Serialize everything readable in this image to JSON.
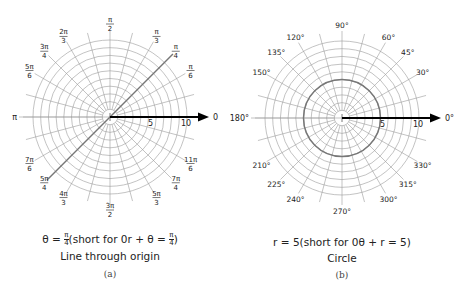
{
  "colors": {
    "grid": "#9a9a9a",
    "axis": "#000000",
    "highlight": "#777777"
  },
  "chart_data": [
    {
      "type": "diagram",
      "title": "Line through origin",
      "panel_label": "(a)",
      "equation": "θ = π/4 (short for 0r + θ = π/4)",
      "center": [
        110,
        117
      ],
      "ring_count": 10,
      "ring_spacing_px": 7.7,
      "axis_labels": {
        "five": "5",
        "ten": "10",
        "zero": "0",
        "pi": "π"
      },
      "angle_labels": [
        {
          "deg": 90,
          "num": "π",
          "den": "2"
        },
        {
          "deg": 60,
          "num": "π",
          "den": "3"
        },
        {
          "deg": 45,
          "num": "π",
          "den": "4"
        },
        {
          "deg": 30,
          "num": "π",
          "den": "6"
        },
        {
          "deg": 120,
          "num": "2π",
          "den": "3"
        },
        {
          "deg": 135,
          "num": "3π",
          "den": "4"
        },
        {
          "deg": 150,
          "num": "5π",
          "den": "6"
        },
        {
          "deg": 210,
          "num": "7π",
          "den": "6"
        },
        {
          "deg": 225,
          "num": "5π",
          "den": "4"
        },
        {
          "deg": 240,
          "num": "4π",
          "den": "3"
        },
        {
          "deg": 270,
          "num": "3π",
          "den": "2"
        },
        {
          "deg": 300,
          "num": "5π",
          "den": "3"
        },
        {
          "deg": 315,
          "num": "7π",
          "den": "4"
        },
        {
          "deg": 330,
          "num": "11π",
          "den": "6"
        }
      ],
      "plotted": {
        "kind": "line",
        "theta_deg": 45
      }
    },
    {
      "type": "diagram",
      "title": "Circle",
      "panel_label": "(b)",
      "equation": "r = 5 (short for 0θ + r = 5)",
      "center": [
        342,
        118
      ],
      "ring_count": 10,
      "ring_spacing_px": 7.7,
      "axis_labels": {
        "five": "5",
        "ten": "10",
        "zero": "0°",
        "pi": "180°"
      },
      "angle_labels": [
        {
          "deg": 90,
          "text": "90°"
        },
        {
          "deg": 60,
          "text": "60°"
        },
        {
          "deg": 45,
          "text": "45°"
        },
        {
          "deg": 30,
          "text": "30°"
        },
        {
          "deg": 120,
          "text": "120°"
        },
        {
          "deg": 135,
          "text": "135°"
        },
        {
          "deg": 150,
          "text": "150°"
        },
        {
          "deg": 210,
          "text": "210°"
        },
        {
          "deg": 225,
          "text": "225°"
        },
        {
          "deg": 240,
          "text": "240°"
        },
        {
          "deg": 270,
          "text": "270°"
        },
        {
          "deg": 300,
          "text": "300°"
        },
        {
          "deg": 315,
          "text": "315°"
        },
        {
          "deg": 330,
          "text": "330°"
        }
      ],
      "plotted": {
        "kind": "circle",
        "r": 5
      }
    }
  ],
  "captions": {
    "a": {
      "eq_theta": "θ = ",
      "frac_num": "π",
      "frac_den": "4",
      "eq_rest": "(short for 0r + θ = ",
      "eq_close": ")",
      "title": "Line through origin",
      "label": "(a)"
    },
    "b": {
      "equation": "r = 5(short for 0θ + r = 5)",
      "title": "Circle",
      "label": "(b)"
    }
  }
}
